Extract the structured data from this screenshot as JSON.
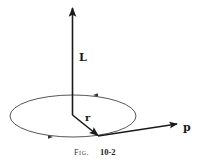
{
  "figure": {
    "caption_prefix": "Fig.",
    "caption_number": "10-2",
    "labels": {
      "angular_momentum": "L",
      "position": "r",
      "momentum": "p"
    },
    "colors": {
      "background": "#ffffff",
      "ink": "#1a1a1a",
      "orbit": "#444444"
    },
    "elements": [
      {
        "name": "orbit-ellipse",
        "description": "elliptical orbit with direction arrows (counter-clockwise as viewed)"
      },
      {
        "name": "L-vector",
        "description": "vertical arrow pointing up from orbit center"
      },
      {
        "name": "r-vector",
        "description": "arrow from center to point on orbit"
      },
      {
        "name": "p-vector",
        "description": "tangent arrow at orbit point"
      }
    ]
  }
}
